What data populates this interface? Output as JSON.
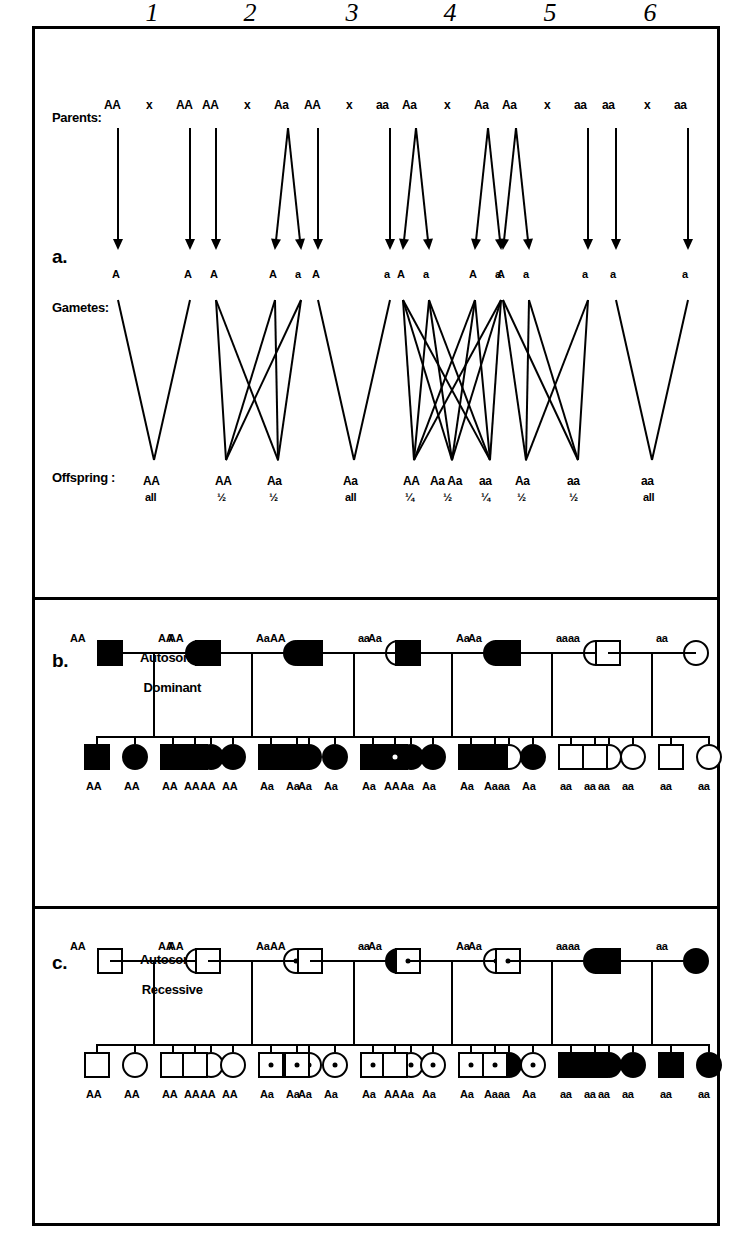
{
  "figure": {
    "orientation": "rotated-90-ccw",
    "column_numbers": [
      "1",
      "2",
      "3",
      "4",
      "5",
      "6"
    ],
    "panels": [
      {
        "key": "a",
        "letter": "a.",
        "name": ""
      },
      {
        "key": "b",
        "letter": "b.",
        "name_line1": "Autosomal",
        "name_line2": "Dominant"
      },
      {
        "key": "c",
        "letter": "c.",
        "name_line1": "Autosomal",
        "name_line2": "Recessive"
      }
    ]
  },
  "panel_a": {
    "row_labels": {
      "parents": "Parents:",
      "gametes": "Gametes:",
      "offspring": "Offspring :"
    },
    "cross_symbol": "x",
    "crosses": [
      {
        "n": "1",
        "parent_left": "AA",
        "parent_right": "AA",
        "gametes_left": [
          "A"
        ],
        "gametes_right": [
          "A"
        ],
        "offspring": [
          {
            "genotype": "AA",
            "ratio": "all"
          }
        ]
      },
      {
        "n": "2",
        "parent_left": "AA",
        "parent_right": "Aa",
        "gametes_left": [
          "A"
        ],
        "gametes_right": [
          "A",
          "a"
        ],
        "offspring": [
          {
            "genotype": "AA",
            "ratio": "½"
          },
          {
            "genotype": "Aa",
            "ratio": "½"
          }
        ]
      },
      {
        "n": "3",
        "parent_left": "AA",
        "parent_right": "aa",
        "gametes_left": [
          "A"
        ],
        "gametes_right": [
          "a"
        ],
        "offspring": [
          {
            "genotype": "Aa",
            "ratio": "all"
          }
        ]
      },
      {
        "n": "4",
        "parent_left": "Aa",
        "parent_right": "Aa",
        "gametes_left": [
          "A",
          "a"
        ],
        "gametes_right": [
          "A",
          "a"
        ],
        "offspring": [
          {
            "genotype": "AA",
            "ratio": "¼"
          },
          {
            "genotype": "Aa  Aa",
            "ratio": "½"
          },
          {
            "genotype": "aa",
            "ratio": "¼"
          }
        ]
      },
      {
        "n": "5",
        "parent_left": "Aa",
        "parent_right": "aa",
        "gametes_left": [
          "A",
          "a"
        ],
        "gametes_right": [
          "a"
        ],
        "offspring": [
          {
            "genotype": "Aa",
            "ratio": "½"
          },
          {
            "genotype": "aa",
            "ratio": "½"
          }
        ]
      },
      {
        "n": "6",
        "parent_left": "aa",
        "parent_right": "aa",
        "gametes_left": [
          "a"
        ],
        "gametes_right": [
          "a"
        ],
        "offspring": [
          {
            "genotype": "aa",
            "ratio": "all"
          }
        ]
      }
    ]
  },
  "panel_b": {
    "title_line1": "Autosomal",
    "title_line2": "Dominant",
    "letter": "b.",
    "families": [
      {
        "n": "1",
        "father": {
          "shape": "square",
          "fill": "filled",
          "genotype": "AA"
        },
        "mother": {
          "shape": "circle",
          "fill": "filled",
          "genotype": "AA"
        },
        "children": [
          {
            "shape": "square",
            "fill": "filled",
            "genotype": "AA"
          },
          {
            "shape": "circle",
            "fill": "filled",
            "genotype": "AA"
          },
          {
            "shape": "square",
            "fill": "filled",
            "genotype": "AA"
          },
          {
            "shape": "circle",
            "fill": "filled",
            "genotype": "AA"
          }
        ]
      },
      {
        "n": "2",
        "father": {
          "shape": "square",
          "fill": "filled",
          "genotype": "AA"
        },
        "mother": {
          "shape": "circle",
          "fill": "filled",
          "genotype": "Aa"
        },
        "children": [
          {
            "shape": "square",
            "fill": "filled",
            "genotype": "AA"
          },
          {
            "shape": "circle",
            "fill": "filled",
            "genotype": "AA"
          },
          {
            "shape": "square",
            "fill": "filled",
            "genotype": "Aa"
          },
          {
            "shape": "circle",
            "fill": "filled",
            "genotype": "Aa"
          }
        ]
      },
      {
        "n": "3",
        "father": {
          "shape": "square",
          "fill": "filled",
          "genotype": "AA"
        },
        "mother": {
          "shape": "circle",
          "fill": "open",
          "genotype": "aa"
        },
        "children": [
          {
            "shape": "square",
            "fill": "filled",
            "genotype": "Aa"
          },
          {
            "shape": "circle",
            "fill": "filled",
            "genotype": "Aa"
          },
          {
            "shape": "square",
            "fill": "filled",
            "genotype": "Aa"
          },
          {
            "shape": "circle",
            "fill": "filled",
            "genotype": "Aa"
          }
        ]
      },
      {
        "n": "4",
        "father": {
          "shape": "square",
          "fill": "filled",
          "genotype": "Aa"
        },
        "mother": {
          "shape": "circle",
          "fill": "filled",
          "genotype": "Aa"
        },
        "children": [
          {
            "shape": "square",
            "fill": "filled",
            "genotype": "AA",
            "marker": "light-dot"
          },
          {
            "shape": "circle",
            "fill": "filled",
            "genotype": "Aa"
          },
          {
            "shape": "square",
            "fill": "filled",
            "genotype": "Aa"
          },
          {
            "shape": "circle",
            "fill": "open",
            "genotype": "aa"
          }
        ]
      },
      {
        "n": "5",
        "father": {
          "shape": "square",
          "fill": "filled",
          "genotype": "Aa"
        },
        "mother": {
          "shape": "circle",
          "fill": "open",
          "genotype": "aa"
        },
        "children": [
          {
            "shape": "square",
            "fill": "filled",
            "genotype": "Aa"
          },
          {
            "shape": "circle",
            "fill": "filled",
            "genotype": "Aa"
          },
          {
            "shape": "square",
            "fill": "open",
            "genotype": "aa"
          },
          {
            "shape": "circle",
            "fill": "open",
            "genotype": "aa"
          }
        ]
      },
      {
        "n": "6",
        "father": {
          "shape": "square",
          "fill": "open",
          "genotype": "aa"
        },
        "mother": {
          "shape": "circle",
          "fill": "open",
          "genotype": "aa"
        },
        "children": [
          {
            "shape": "square",
            "fill": "open",
            "genotype": "aa"
          },
          {
            "shape": "circle",
            "fill": "open",
            "genotype": "aa"
          },
          {
            "shape": "square",
            "fill": "open",
            "genotype": "aa"
          },
          {
            "shape": "circle",
            "fill": "open",
            "genotype": "aa"
          }
        ]
      }
    ]
  },
  "panel_c": {
    "title_line1": "Autosomal",
    "title_line2": "Recessive",
    "letter": "c.",
    "families": [
      {
        "n": "1",
        "father": {
          "shape": "square",
          "fill": "open",
          "genotype": "AA"
        },
        "mother": {
          "shape": "circle",
          "fill": "open",
          "genotype": "AA"
        },
        "children": [
          {
            "shape": "square",
            "fill": "open",
            "genotype": "AA"
          },
          {
            "shape": "circle",
            "fill": "open",
            "genotype": "AA"
          },
          {
            "shape": "square",
            "fill": "open",
            "genotype": "AA"
          },
          {
            "shape": "circle",
            "fill": "open",
            "genotype": "AA"
          }
        ]
      },
      {
        "n": "2",
        "father": {
          "shape": "square",
          "fill": "open",
          "genotype": "AA"
        },
        "mother": {
          "shape": "circle",
          "fill": "carrier",
          "genotype": "Aa"
        },
        "children": [
          {
            "shape": "square",
            "fill": "open",
            "genotype": "AA"
          },
          {
            "shape": "circle",
            "fill": "open",
            "genotype": "AA"
          },
          {
            "shape": "square",
            "fill": "carrier",
            "genotype": "Aa"
          },
          {
            "shape": "circle",
            "fill": "carrier",
            "genotype": "Aa"
          }
        ]
      },
      {
        "n": "3",
        "father": {
          "shape": "square",
          "fill": "open",
          "genotype": "AA"
        },
        "mother": {
          "shape": "circle",
          "fill": "filled",
          "genotype": "aa"
        },
        "children": [
          {
            "shape": "square",
            "fill": "carrier",
            "genotype": "Aa"
          },
          {
            "shape": "circle",
            "fill": "carrier",
            "genotype": "Aa"
          },
          {
            "shape": "square",
            "fill": "carrier",
            "genotype": "Aa"
          },
          {
            "shape": "circle",
            "fill": "carrier",
            "genotype": "Aa"
          }
        ]
      },
      {
        "n": "4",
        "father": {
          "shape": "square",
          "fill": "carrier",
          "genotype": "Aa"
        },
        "mother": {
          "shape": "circle",
          "fill": "carrier",
          "genotype": "Aa"
        },
        "children": [
          {
            "shape": "square",
            "fill": "open",
            "genotype": "AA"
          },
          {
            "shape": "circle",
            "fill": "carrier",
            "genotype": "Aa"
          },
          {
            "shape": "square",
            "fill": "carrier",
            "genotype": "Aa"
          },
          {
            "shape": "circle",
            "fill": "filled",
            "genotype": "aa"
          }
        ]
      },
      {
        "n": "5",
        "father": {
          "shape": "square",
          "fill": "carrier",
          "genotype": "Aa"
        },
        "mother": {
          "shape": "circle",
          "fill": "filled",
          "genotype": "aa"
        },
        "children": [
          {
            "shape": "square",
            "fill": "carrier",
            "genotype": "Aa"
          },
          {
            "shape": "circle",
            "fill": "carrier",
            "genotype": "Aa"
          },
          {
            "shape": "square",
            "fill": "filled",
            "genotype": "aa"
          },
          {
            "shape": "circle",
            "fill": "filled",
            "genotype": "aa"
          }
        ]
      },
      {
        "n": "6",
        "father": {
          "shape": "square",
          "fill": "filled",
          "genotype": "aa"
        },
        "mother": {
          "shape": "circle",
          "fill": "filled",
          "genotype": "aa"
        },
        "children": [
          {
            "shape": "square",
            "fill": "filled",
            "genotype": "aa"
          },
          {
            "shape": "circle",
            "fill": "filled",
            "genotype": "aa"
          },
          {
            "shape": "square",
            "fill": "filled",
            "genotype": "aa"
          },
          {
            "shape": "circle",
            "fill": "filled",
            "genotype": "aa"
          }
        ]
      }
    ]
  }
}
